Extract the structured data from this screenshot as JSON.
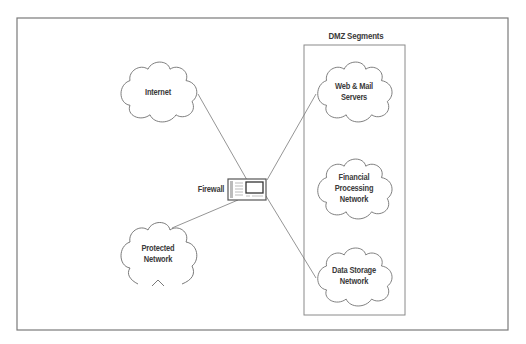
{
  "diagram": {
    "title": "DMZ Segments",
    "colors": {
      "stroke": "#6b6b6b",
      "frame": "#7a7a7a",
      "text": "#3a3a3a",
      "background": "#ffffff"
    },
    "firewall": {
      "label": "Firewall",
      "icon": "firewall-appliance-icon"
    },
    "external": {
      "internet": {
        "label": "Internet",
        "icon": "cloud-icon"
      },
      "protected": {
        "label_line1": "Protected",
        "label_line2": "Network",
        "icon": "cloud-icon"
      }
    },
    "dmz": {
      "title": "DMZ Segments",
      "segments": [
        {
          "label_line1": "Web & Mail",
          "label_line2": "Servers",
          "icon": "cloud-icon"
        },
        {
          "label_line1": "Financial",
          "label_line2": "Processing",
          "label_line3": "Network",
          "icon": "cloud-icon"
        },
        {
          "label_line1": "Data Storage",
          "label_line2": "Network",
          "icon": "cloud-icon"
        }
      ]
    },
    "connections": [
      {
        "from": "Internet",
        "to": "Firewall"
      },
      {
        "from": "Protected Network",
        "to": "Firewall"
      },
      {
        "from": "Firewall",
        "to": "Web & Mail Servers"
      },
      {
        "from": "Firewall",
        "to": "Data Storage Network"
      }
    ]
  }
}
